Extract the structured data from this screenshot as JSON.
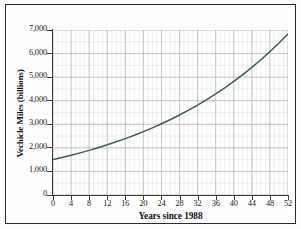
{
  "figure": {
    "background_color": "#fefefe",
    "frame_color": "#2b2b2b"
  },
  "chart_data": {
    "type": "line",
    "title": "",
    "subtitle": "",
    "xlabel": "Years since 1988",
    "ylabel": "Vechicle Miles (billions)",
    "xlim": [
      0,
      52
    ],
    "ylim": [
      0,
      7000
    ],
    "xticks": [
      0,
      4,
      8,
      12,
      16,
      20,
      24,
      28,
      32,
      36,
      40,
      44,
      48,
      52
    ],
    "xtick_labels": [
      "0",
      "4",
      "8",
      "12",
      "16",
      "20",
      "24",
      "28",
      "32",
      "36",
      "40",
      "44",
      "48",
      "52"
    ],
    "yticks": [
      0,
      1000,
      2000,
      3000,
      4000,
      5000,
      6000,
      7000
    ],
    "ytick_labels": [
      "0",
      "1,000",
      "2,000",
      "3,000",
      "4,000",
      "5,000",
      "6,000",
      "7,000"
    ],
    "grid": true,
    "grid_major_color": "#b5b5b5",
    "grid_minor_color": "#dedede",
    "x_minor_step": 1,
    "y_minor_step": 500,
    "legend": null,
    "legend_position": "none",
    "annotations": [],
    "series": [
      {
        "name": "Vehicle miles traveled",
        "color": "#3d5d58",
        "line_width": 1.5,
        "x": [
          0,
          2,
          4,
          6,
          8,
          10,
          12,
          14,
          16,
          18,
          20,
          22,
          24,
          26,
          28,
          30,
          32,
          34,
          36,
          38,
          40,
          42,
          44,
          46,
          48,
          50,
          52
        ],
        "values": [
          1500,
          1590,
          1685,
          1787,
          1894,
          2008,
          2129,
          2257,
          2392,
          2536,
          2688,
          2850,
          3021,
          3203,
          3395,
          3599,
          3815,
          4044,
          4287,
          4544,
          4817,
          5106,
          5412,
          5737,
          6081,
          6446,
          6833
        ]
      }
    ]
  }
}
